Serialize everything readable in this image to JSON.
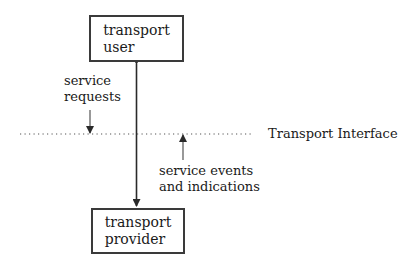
{
  "diagram": {
    "top_box": {
      "label": "transport\nuser"
    },
    "bottom_box": {
      "label": "transport\nprovider"
    },
    "interface_label": "Transport Interface",
    "requests_label": "service\nrequests",
    "events_label": "service events\nand indications"
  },
  "colors": {
    "line": "#3a3a3a",
    "text": "#1a1a1a",
    "background": "#ffffff"
  }
}
